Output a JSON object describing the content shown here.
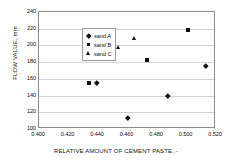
{
  "chart_data": {
    "type": "scatter",
    "title": "",
    "xlabel": "RELATIVE AMOUNT OF CEMENT PASTE, -",
    "ylabel": "FLOW VALUE, mm",
    "xlim": [
      0.4,
      0.52
    ],
    "ylim": [
      100,
      240
    ],
    "xticks": [
      "0.400",
      "0.420",
      "0.440",
      "0.460",
      "0.480",
      "0.500",
      "0.520"
    ],
    "xtick_values": [
      0.4,
      0.42,
      0.44,
      0.46,
      0.48,
      0.5,
      0.52
    ],
    "yticks": [
      "100",
      "120",
      "140",
      "160",
      "180",
      "200",
      "220",
      "240"
    ],
    "ytick_values": [
      100,
      120,
      140,
      160,
      180,
      200,
      220,
      240
    ],
    "grid": "horizontal",
    "legend_position": "top-left",
    "marker_color": "#111111",
    "series": [
      {
        "name": "sand A",
        "marker": "diamond",
        "points": [
          {
            "x": 0.439,
            "y": 155
          },
          {
            "x": 0.46,
            "y": 113
          },
          {
            "x": 0.487,
            "y": 140
          },
          {
            "x": 0.513,
            "y": 176
          }
        ]
      },
      {
        "name": "sand B",
        "marker": "square",
        "points": [
          {
            "x": 0.434,
            "y": 155
          },
          {
            "x": 0.473,
            "y": 183
          },
          {
            "x": 0.501,
            "y": 218
          }
        ]
      },
      {
        "name": "sand C",
        "marker": "triangle",
        "points": [
          {
            "x": 0.446,
            "y": 193
          },
          {
            "x": 0.454,
            "y": 198
          },
          {
            "x": 0.465,
            "y": 208
          }
        ]
      }
    ]
  },
  "legend": {
    "items": [
      {
        "label": "sand A",
        "marker": "diamond"
      },
      {
        "label": "sand B",
        "marker": "square"
      },
      {
        "label": "sand C",
        "marker": "triangle"
      }
    ]
  },
  "axes": {
    "x_title": "RELATIVE AMOUNT OF CEMENT PASTE, -",
    "y_title": "FLOW VALUE, mm"
  }
}
